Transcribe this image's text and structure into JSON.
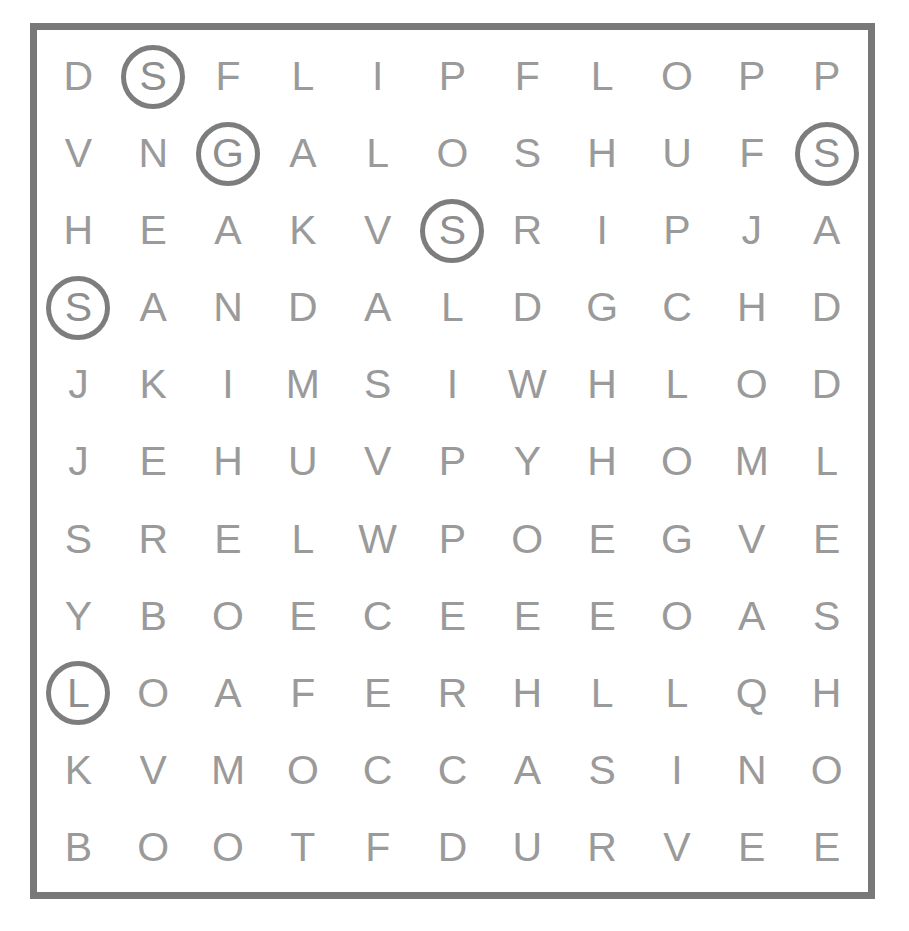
{
  "puzzle": {
    "type": "word-search",
    "rows": 11,
    "columns": 11,
    "border_color": "#787878",
    "letter_color": "#9a9a9a",
    "circle_color": "#7d7d7d",
    "background_color": "#ffffff",
    "grid": [
      [
        "D",
        "S",
        "F",
        "L",
        "I",
        "P",
        "F",
        "L",
        "O",
        "P",
        "P"
      ],
      [
        "V",
        "N",
        "G",
        "A",
        "L",
        "O",
        "S",
        "H",
        "U",
        "F",
        "S"
      ],
      [
        "H",
        "E",
        "A",
        "K",
        "V",
        "S",
        "R",
        "I",
        "P",
        "J",
        "A"
      ],
      [
        "S",
        "A",
        "N",
        "D",
        "A",
        "L",
        "D",
        "G",
        "C",
        "H",
        "D"
      ],
      [
        "J",
        "K",
        "I",
        "M",
        "S",
        "I",
        "W",
        "H",
        "L",
        "O",
        "D"
      ],
      [
        "J",
        "E",
        "H",
        "U",
        "V",
        "P",
        "Y",
        "H",
        "O",
        "M",
        "L"
      ],
      [
        "S",
        "R",
        "E",
        "L",
        "W",
        "P",
        "O",
        "E",
        "G",
        "V",
        "E"
      ],
      [
        "Y",
        "B",
        "O",
        "E",
        "C",
        "E",
        "E",
        "E",
        "O",
        "A",
        "S"
      ],
      [
        "L",
        "O",
        "A",
        "F",
        "E",
        "R",
        "H",
        "L",
        "L",
        "Q",
        "H"
      ],
      [
        "K",
        "V",
        "M",
        "O",
        "C",
        "C",
        "A",
        "S",
        "I",
        "N",
        "O"
      ],
      [
        "B",
        "O",
        "O",
        "T",
        "F",
        "D",
        "U",
        "R",
        "V",
        "E",
        "E"
      ]
    ],
    "circled": [
      {
        "row": 0,
        "col": 1,
        "letter": "S"
      },
      {
        "row": 1,
        "col": 2,
        "letter": "G"
      },
      {
        "row": 1,
        "col": 10,
        "letter": "S"
      },
      {
        "row": 2,
        "col": 5,
        "letter": "S"
      },
      {
        "row": 3,
        "col": 0,
        "letter": "S"
      },
      {
        "row": 8,
        "col": 0,
        "letter": "L"
      }
    ]
  }
}
